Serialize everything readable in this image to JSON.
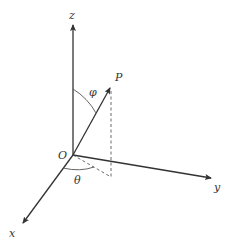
{
  "diagram": {
    "labels": {
      "z_axis": "z",
      "y_axis": "y",
      "x_axis": "x",
      "origin": "O",
      "point": "P",
      "polar_angle": "φ",
      "azimuth_angle": "θ"
    },
    "colors": {
      "line": "#333333",
      "background": "#ffffff"
    }
  }
}
